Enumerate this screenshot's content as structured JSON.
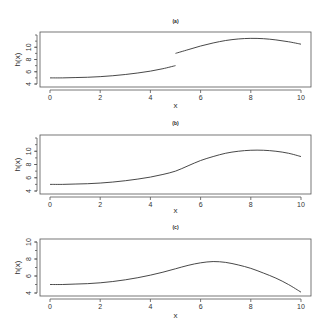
{
  "chart_data": [
    {
      "type": "line",
      "title": "(a)",
      "xlabel": "x",
      "ylabel": "h(x)",
      "xlim": [
        0,
        10
      ],
      "ylim": [
        4,
        12
      ],
      "xticks": [
        0,
        2,
        4,
        6,
        8,
        10
      ],
      "yticks": [
        4,
        6,
        8,
        10
      ],
      "series": [
        {
          "name": "h(x) for x<5",
          "x": [
            0,
            0.5,
            1,
            1.5,
            2,
            2.5,
            3,
            3.5,
            4,
            4.5,
            5
          ],
          "y": [
            5.0,
            5.0,
            5.05,
            5.1,
            5.2,
            5.35,
            5.55,
            5.8,
            6.1,
            6.5,
            7.0
          ]
        },
        {
          "name": "h(x) for x>=5",
          "x": [
            5,
            5.5,
            6,
            6.5,
            7,
            7.5,
            8,
            8.5,
            9,
            9.5,
            10
          ],
          "y": [
            9.0,
            9.6,
            10.2,
            10.7,
            11.1,
            11.35,
            11.45,
            11.4,
            11.2,
            10.9,
            10.5
          ]
        }
      ]
    },
    {
      "type": "line",
      "title": "(b)",
      "xlabel": "x",
      "ylabel": "h(x)",
      "xlim": [
        0,
        10
      ],
      "ylim": [
        4,
        12
      ],
      "xticks": [
        0,
        2,
        4,
        6,
        8,
        10
      ],
      "yticks": [
        4,
        6,
        8,
        10
      ],
      "series": [
        {
          "name": "h(x)",
          "x": [
            0,
            0.5,
            1,
            1.5,
            2,
            2.5,
            3,
            3.5,
            4,
            4.5,
            5,
            5.5,
            6,
            6.5,
            7,
            7.5,
            8,
            8.5,
            9,
            9.5,
            10
          ],
          "y": [
            5.0,
            5.0,
            5.05,
            5.1,
            5.2,
            5.35,
            5.55,
            5.8,
            6.1,
            6.5,
            7.0,
            7.8,
            8.6,
            9.2,
            9.7,
            10.0,
            10.15,
            10.15,
            10.0,
            9.7,
            9.2
          ]
        }
      ]
    },
    {
      "type": "line",
      "title": "(c)",
      "xlabel": "x",
      "ylabel": "h(x)",
      "xlim": [
        0,
        10
      ],
      "ylim": [
        4,
        10
      ],
      "xticks": [
        0,
        2,
        4,
        6,
        8,
        10
      ],
      "yticks": [
        4,
        6,
        8,
        10
      ],
      "series": [
        {
          "name": "h(x)",
          "x": [
            0,
            0.5,
            1,
            1.5,
            2,
            2.5,
            3,
            3.5,
            4,
            4.5,
            5,
            5.5,
            6,
            6.5,
            7,
            7.5,
            8,
            8.5,
            9,
            9.5,
            10
          ],
          "y": [
            5.0,
            5.0,
            5.05,
            5.1,
            5.2,
            5.35,
            5.55,
            5.8,
            6.1,
            6.45,
            6.85,
            7.25,
            7.55,
            7.7,
            7.6,
            7.3,
            6.9,
            6.35,
            5.75,
            5.0,
            4.1
          ]
        }
      ]
    }
  ]
}
